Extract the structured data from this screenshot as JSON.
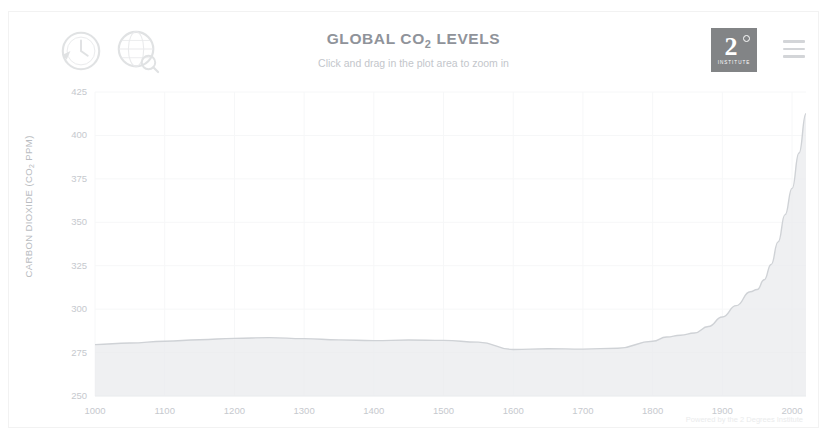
{
  "header": {
    "title_main": "GLOBAL CO",
    "title_sub": "2",
    "title_tail": " LEVELS",
    "title_full": "GLOBAL CO2 LEVELS",
    "subtitle": "Click and drag in the plot area to zoom in",
    "logo_clock": "clock-emblem-icon",
    "logo_globe": "globe-emblem-icon",
    "brand_mark": "2",
    "brand_sub": "INSTITUTE",
    "menu_icon": "hamburger-menu-icon"
  },
  "credit": "Powered by the 2 Degrees Institute",
  "colors": {
    "line": "#cfd2d6",
    "fill": "#e9ebed",
    "grid": "#f6f7f8",
    "text": "#c6c9ce",
    "title": "#8f939a",
    "brand": "#6d6f72"
  },
  "chart_data": {
    "type": "area",
    "title": "GLOBAL CO2 LEVELS",
    "subtitle": "Click and drag in the plot area to zoom in",
    "xlabel": "",
    "ylabel": "CARBON DIOXIDE (CO2 PPM)",
    "xlim": [
      1000,
      2020
    ],
    "ylim": [
      250,
      425
    ],
    "grid": true,
    "legend": "none",
    "xticks": [
      1000,
      1100,
      1200,
      1300,
      1400,
      1500,
      1600,
      1700,
      1800,
      1900,
      2000
    ],
    "yticks": [
      250,
      275,
      300,
      325,
      350,
      375,
      400,
      425
    ],
    "series": [
      {
        "name": "Carbon Dioxide (CO2 PPM)",
        "x": [
          1000,
          1050,
          1100,
          1150,
          1200,
          1250,
          1300,
          1350,
          1400,
          1450,
          1500,
          1550,
          1600,
          1650,
          1700,
          1750,
          1800,
          1820,
          1840,
          1860,
          1880,
          1900,
          1920,
          1940,
          1950,
          1960,
          1970,
          1980,
          1990,
          2000,
          2010,
          2020
        ],
        "values": [
          279.6,
          280.5,
          281.5,
          282.4,
          283.2,
          283.6,
          283.0,
          282.3,
          281.9,
          282.2,
          282.0,
          281.0,
          276.8,
          277.2,
          277.0,
          277.5,
          281.5,
          284.0,
          285.0,
          286.3,
          290.0,
          295.5,
          302.0,
          310.0,
          311.3,
          316.9,
          325.7,
          338.7,
          354.4,
          369.5,
          389.9,
          412.5
        ]
      }
    ]
  }
}
